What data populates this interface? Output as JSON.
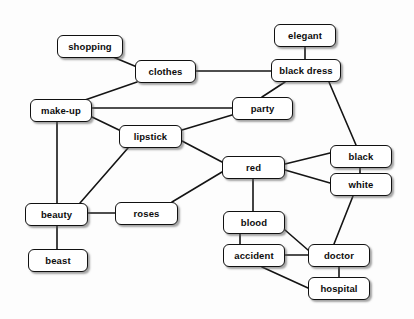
{
  "diagram": {
    "type": "node-link-graph",
    "width": 414,
    "height": 319,
    "background_color": "#fdfdfd",
    "node_fill_color": "#ffffff",
    "node_border_color": "#111111",
    "edge_color": "#141414",
    "label_color": "#0d0d0d",
    "nodes": [
      {
        "id": "shopping",
        "label": "shopping",
        "x": 57,
        "y": 35,
        "w": 66,
        "h": 23
      },
      {
        "id": "clothes",
        "label": "clothes",
        "x": 135,
        "y": 60,
        "w": 61,
        "h": 23
      },
      {
        "id": "elegant",
        "label": "elegant",
        "x": 274,
        "y": 24,
        "w": 62,
        "h": 23
      },
      {
        "id": "black_dress",
        "label": "black dress",
        "x": 271,
        "y": 59,
        "w": 70,
        "h": 23
      },
      {
        "id": "make_up",
        "label": "make-up",
        "x": 30,
        "y": 99,
        "w": 62,
        "h": 23
      },
      {
        "id": "party",
        "label": "party",
        "x": 232,
        "y": 97,
        "w": 61,
        "h": 23
      },
      {
        "id": "lipstick",
        "label": "lipstick",
        "x": 119,
        "y": 125,
        "w": 63,
        "h": 23
      },
      {
        "id": "red",
        "label": "red",
        "x": 222,
        "y": 156,
        "w": 63,
        "h": 23
      },
      {
        "id": "black",
        "label": "black",
        "x": 330,
        "y": 145,
        "w": 62,
        "h": 23
      },
      {
        "id": "white",
        "label": "white",
        "x": 330,
        "y": 173,
        "w": 62,
        "h": 23
      },
      {
        "id": "beauty",
        "label": "beauty",
        "x": 25,
        "y": 203,
        "w": 63,
        "h": 23
      },
      {
        "id": "roses",
        "label": "roses",
        "x": 115,
        "y": 202,
        "w": 63,
        "h": 23
      },
      {
        "id": "blood",
        "label": "blood",
        "x": 223,
        "y": 211,
        "w": 62,
        "h": 23
      },
      {
        "id": "beast",
        "label": "beast",
        "x": 28,
        "y": 249,
        "w": 60,
        "h": 23
      },
      {
        "id": "accident",
        "label": "accident",
        "x": 223,
        "y": 244,
        "w": 62,
        "h": 23
      },
      {
        "id": "doctor",
        "label": "doctor",
        "x": 308,
        "y": 244,
        "w": 62,
        "h": 23
      },
      {
        "id": "hospital",
        "label": "hospital",
        "x": 308,
        "y": 277,
        "w": 62,
        "h": 23
      }
    ],
    "edges": [
      {
        "from": "shopping",
        "to": "clothes",
        "x1": 113,
        "y1": 57,
        "x2": 149,
        "y2": 72
      },
      {
        "from": "clothes",
        "to": "black_dress",
        "x1": 196,
        "y1": 71,
        "x2": 271,
        "y2": 71
      },
      {
        "from": "clothes",
        "to": "make_up",
        "x1": 137,
        "y1": 82,
        "x2": 85,
        "y2": 100
      },
      {
        "from": "elegant",
        "to": "black_dress",
        "x1": 305,
        "y1": 47,
        "x2": 305,
        "y2": 59
      },
      {
        "from": "black_dress",
        "to": "party",
        "x1": 285,
        "y1": 82,
        "x2": 262,
        "y2": 97
      },
      {
        "from": "black_dress",
        "to": "black",
        "x1": 329,
        "y1": 82,
        "x2": 356,
        "y2": 145
      },
      {
        "from": "make_up",
        "to": "party",
        "x1": 92,
        "y1": 108,
        "x2": 232,
        "y2": 108
      },
      {
        "from": "make_up",
        "to": "lipstick",
        "x1": 92,
        "y1": 117,
        "x2": 119,
        "y2": 130
      },
      {
        "from": "make_up",
        "to": "beauty",
        "x1": 57,
        "y1": 122,
        "x2": 57,
        "y2": 203
      },
      {
        "from": "party",
        "to": "lipstick",
        "x1": 232,
        "y1": 115,
        "x2": 182,
        "y2": 130
      },
      {
        "from": "lipstick",
        "to": "red",
        "x1": 182,
        "y1": 141,
        "x2": 222,
        "y2": 162
      },
      {
        "from": "lipstick",
        "to": "beauty",
        "x1": 128,
        "y1": 148,
        "x2": 80,
        "y2": 203
      },
      {
        "from": "red",
        "to": "black",
        "x1": 285,
        "y1": 164,
        "x2": 330,
        "y2": 153
      },
      {
        "from": "red",
        "to": "white",
        "x1": 285,
        "y1": 170,
        "x2": 330,
        "y2": 183
      },
      {
        "from": "red",
        "to": "roses",
        "x1": 222,
        "y1": 172,
        "x2": 172,
        "y2": 202
      },
      {
        "from": "red",
        "to": "blood",
        "x1": 253,
        "y1": 179,
        "x2": 253,
        "y2": 211
      },
      {
        "from": "black",
        "to": "white",
        "x1": 360,
        "y1": 168,
        "x2": 360,
        "y2": 173
      },
      {
        "from": "white",
        "to": "doctor",
        "x1": 353,
        "y1": 196,
        "x2": 334,
        "y2": 244
      },
      {
        "from": "beauty",
        "to": "roses",
        "x1": 88,
        "y1": 213,
        "x2": 115,
        "y2": 213
      },
      {
        "from": "beauty",
        "to": "beast",
        "x1": 57,
        "y1": 226,
        "x2": 57,
        "y2": 249
      },
      {
        "from": "blood",
        "to": "accident",
        "x1": 240,
        "y1": 234,
        "x2": 240,
        "y2": 244
      },
      {
        "from": "blood",
        "to": "doctor",
        "x1": 285,
        "y1": 230,
        "x2": 308,
        "y2": 250
      },
      {
        "from": "accident",
        "to": "doctor",
        "x1": 285,
        "y1": 255,
        "x2": 308,
        "y2": 255
      },
      {
        "from": "accident",
        "to": "hospital",
        "x1": 262,
        "y1": 267,
        "x2": 308,
        "y2": 288
      },
      {
        "from": "doctor",
        "to": "hospital",
        "x1": 339,
        "y1": 267,
        "x2": 339,
        "y2": 277
      }
    ]
  }
}
